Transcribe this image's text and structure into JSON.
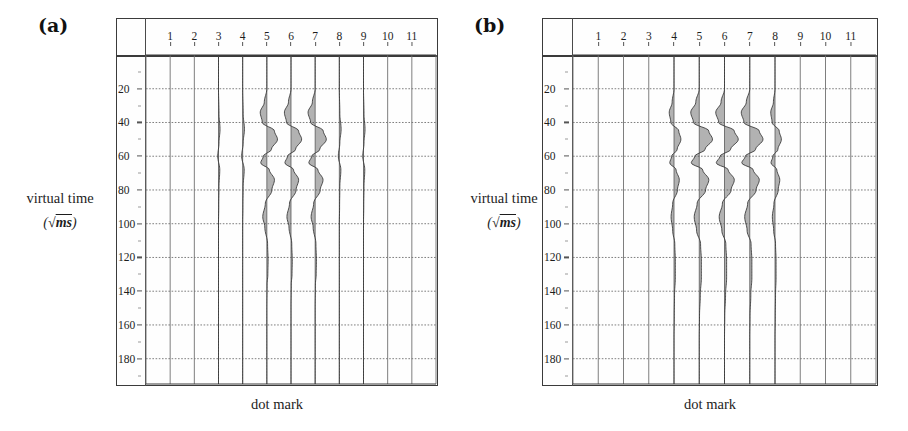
{
  "figure": {
    "background": "#ffffff",
    "axis_color": "#3b3b3b",
    "grid_color": "#6d6d6d",
    "trace_color": "#333333"
  },
  "panels": [
    {
      "id": "a",
      "label": "(a)",
      "ylabel_text": "virtual time",
      "ylabel_unit_open": "(",
      "ylabel_unit_radical": "√",
      "ylabel_unit_value": "ms",
      "ylabel_unit_close": ")",
      "xlabel": "dot mark",
      "x_ticks": [
        "1",
        "2",
        "3",
        "4",
        "5",
        "6",
        "7",
        "8",
        "9",
        "10",
        "11"
      ],
      "y_ticks": [
        "20",
        "40",
        "60",
        "80",
        "100",
        "120",
        "140",
        "160",
        "180"
      ]
    },
    {
      "id": "b",
      "label": "(b)",
      "ylabel_text": "virtual time",
      "ylabel_unit_open": "(",
      "ylabel_unit_radical": "√",
      "ylabel_unit_value": "ms",
      "ylabel_unit_close": ")",
      "xlabel": "dot mark",
      "x_ticks": [
        "1",
        "2",
        "3",
        "4",
        "5",
        "6",
        "7",
        "8",
        "9",
        "10",
        "11"
      ],
      "y_ticks": [
        "20",
        "40",
        "60",
        "80",
        "100",
        "120",
        "140",
        "160",
        "180"
      ]
    }
  ],
  "chart_data": [
    {
      "type": "line",
      "title": "(a)",
      "xlabel": "dot mark",
      "ylabel": "virtual time (√ms)",
      "xlim": [
        0.5,
        11.5
      ],
      "ylim": [
        0,
        195
      ],
      "y_inverted": true,
      "grid": true,
      "x_tick_values": [
        1,
        2,
        3,
        4,
        5,
        6,
        7,
        8,
        9,
        10,
        11
      ],
      "y_tick_values": [
        20,
        40,
        60,
        80,
        100,
        120,
        140,
        160,
        180
      ],
      "legend": "none",
      "description": "Seismic wiggle traces; amplitude plotted horizontally about each dot-mark position, virtual time increasing downward.",
      "series": [
        {
          "name": "trace 1",
          "x_center": 1,
          "amplitude": 0.0,
          "t": [
            0,
            20,
            40,
            60,
            80,
            100,
            120,
            140,
            160,
            180,
            195
          ],
          "values": [
            0,
            0,
            0,
            0,
            0,
            0,
            0,
            0,
            0,
            0,
            0
          ]
        },
        {
          "name": "trace 2",
          "x_center": 2,
          "amplitude": 0.0,
          "t": [
            0,
            20,
            40,
            60,
            80,
            100,
            120,
            140,
            160,
            180,
            195
          ],
          "values": [
            0,
            0,
            0,
            0,
            0,
            0,
            0,
            0,
            0,
            0,
            0
          ]
        },
        {
          "name": "trace 3",
          "x_center": 3,
          "amplitude": 0.06,
          "t": [
            0,
            20,
            35,
            44,
            52,
            60,
            68,
            78,
            90,
            100,
            120,
            140,
            160,
            180,
            195
          ],
          "values": [
            0,
            0,
            0.02,
            0.06,
            0.02,
            -0.03,
            0.05,
            0.02,
            0.01,
            0,
            0,
            0,
            0,
            0,
            0
          ]
        },
        {
          "name": "trace 4",
          "x_center": 4,
          "amplitude": 0.07,
          "t": [
            0,
            20,
            35,
            44,
            52,
            60,
            68,
            78,
            90,
            100,
            120,
            140,
            160,
            180,
            195
          ],
          "values": [
            0,
            0,
            0.02,
            0.07,
            0.02,
            -0.04,
            0.06,
            0.02,
            0.01,
            0,
            0,
            0,
            0,
            0,
            0
          ]
        },
        {
          "name": "trace 5",
          "x_center": 5,
          "amplitude": 0.42,
          "t": [
            0,
            20,
            28,
            34,
            40,
            45,
            50,
            56,
            60,
            64,
            68,
            74,
            80,
            88,
            96,
            102,
            112,
            122,
            130,
            136,
            150,
            165,
            180,
            195
          ],
          "values": [
            0,
            0,
            -0.1,
            -0.26,
            -0.18,
            0.3,
            0.42,
            0.18,
            -0.14,
            -0.24,
            0.1,
            0.3,
            0.2,
            -0.06,
            -0.16,
            -0.08,
            0.03,
            0.05,
            0.04,
            0.01,
            0,
            0,
            0,
            0
          ]
        },
        {
          "name": "trace 6",
          "x_center": 6,
          "amplitude": 0.42,
          "t": [
            0,
            20,
            28,
            34,
            40,
            45,
            50,
            56,
            60,
            64,
            68,
            74,
            80,
            88,
            96,
            102,
            112,
            122,
            130,
            136,
            150,
            165,
            180,
            195
          ],
          "values": [
            0,
            0,
            -0.1,
            -0.26,
            -0.18,
            0.3,
            0.42,
            0.18,
            -0.14,
            -0.24,
            0.1,
            0.3,
            0.2,
            -0.06,
            -0.16,
            -0.08,
            0.03,
            0.05,
            0.04,
            0.01,
            0,
            0,
            0,
            0
          ]
        },
        {
          "name": "trace 7",
          "x_center": 7,
          "amplitude": 0.44,
          "t": [
            0,
            20,
            28,
            34,
            40,
            45,
            50,
            56,
            60,
            64,
            68,
            74,
            80,
            88,
            96,
            102,
            112,
            122,
            130,
            136,
            150,
            165,
            180,
            195
          ],
          "values": [
            0,
            0,
            -0.11,
            -0.28,
            -0.18,
            0.32,
            0.44,
            0.18,
            -0.14,
            -0.25,
            0.11,
            0.31,
            0.2,
            -0.06,
            -0.16,
            -0.08,
            0.03,
            0.05,
            0.04,
            0.01,
            0,
            0,
            0,
            0
          ]
        },
        {
          "name": "trace 8",
          "x_center": 8,
          "amplitude": 0.07,
          "t": [
            0,
            20,
            35,
            44,
            52,
            60,
            68,
            78,
            90,
            100,
            120,
            140,
            160,
            180,
            195
          ],
          "values": [
            0,
            0,
            0.02,
            0.07,
            0.02,
            -0.04,
            0.06,
            0.02,
            0.01,
            0,
            0,
            0,
            0,
            0,
            0
          ]
        },
        {
          "name": "trace 9",
          "x_center": 9,
          "amplitude": 0.06,
          "t": [
            0,
            20,
            35,
            44,
            52,
            60,
            68,
            78,
            90,
            100,
            120,
            140,
            160,
            180,
            195
          ],
          "values": [
            0,
            0,
            0.02,
            0.06,
            0.02,
            -0.03,
            0.05,
            0.02,
            0.01,
            0,
            0,
            0,
            0,
            0,
            0
          ]
        },
        {
          "name": "trace 10",
          "x_center": 10,
          "amplitude": 0.0,
          "t": [
            0,
            20,
            40,
            60,
            80,
            100,
            120,
            140,
            160,
            180,
            195
          ],
          "values": [
            0,
            0,
            0,
            0,
            0,
            0,
            0,
            0,
            0,
            0,
            0
          ]
        },
        {
          "name": "trace 11",
          "x_center": 11,
          "amplitude": 0.0,
          "t": [
            0,
            20,
            40,
            60,
            80,
            100,
            120,
            140,
            160,
            180,
            195
          ],
          "values": [
            0,
            0,
            0,
            0,
            0,
            0,
            0,
            0,
            0,
            0,
            0
          ]
        }
      ]
    },
    {
      "type": "line",
      "title": "(b)",
      "xlabel": "dot mark",
      "ylabel": "virtual time (√ms)",
      "xlim": [
        0.5,
        11.5
      ],
      "ylim": [
        0,
        195
      ],
      "y_inverted": true,
      "grid": true,
      "x_tick_values": [
        1,
        2,
        3,
        4,
        5,
        6,
        7,
        8,
        9,
        10,
        11
      ],
      "y_tick_values": [
        20,
        40,
        60,
        80,
        100,
        120,
        140,
        160,
        180
      ],
      "legend": "none",
      "description": "Seismic wiggle traces with stronger, broader events at dot marks 4 through 8.",
      "series": [
        {
          "name": "trace 1",
          "x_center": 1,
          "amplitude": 0.0,
          "t": [
            0,
            20,
            40,
            60,
            80,
            100,
            120,
            140,
            160,
            180,
            195
          ],
          "values": [
            0,
            0,
            0,
            0,
            0,
            0,
            0,
            0,
            0,
            0,
            0
          ]
        },
        {
          "name": "trace 2",
          "x_center": 2,
          "amplitude": 0.0,
          "t": [
            0,
            20,
            40,
            60,
            80,
            100,
            120,
            140,
            160,
            180,
            195
          ],
          "values": [
            0,
            0,
            0,
            0,
            0,
            0,
            0,
            0,
            0,
            0,
            0
          ]
        },
        {
          "name": "trace 3",
          "x_center": 3,
          "amplitude": 0.0,
          "t": [
            0,
            20,
            40,
            60,
            80,
            100,
            120,
            140,
            160,
            180,
            195
          ],
          "values": [
            0,
            0,
            0,
            0,
            0,
            0,
            0,
            0,
            0,
            0,
            0
          ]
        },
        {
          "name": "trace 4",
          "x_center": 4,
          "amplitude": 0.26,
          "t": [
            0,
            20,
            28,
            34,
            40,
            45,
            50,
            56,
            60,
            64,
            68,
            74,
            80,
            88,
            96,
            104,
            112,
            122,
            132,
            142,
            155,
            168,
            180,
            195
          ],
          "values": [
            0,
            0,
            -0.07,
            -0.18,
            -0.12,
            0.18,
            0.26,
            0.12,
            -0.09,
            -0.16,
            0.08,
            0.2,
            0.13,
            -0.05,
            -0.11,
            -0.05,
            0.03,
            0.05,
            0.05,
            0.02,
            0.01,
            0,
            0,
            0
          ]
        },
        {
          "name": "trace 5",
          "x_center": 5,
          "amplitude": 0.5,
          "t": [
            0,
            20,
            28,
            34,
            40,
            45,
            50,
            56,
            60,
            64,
            68,
            74,
            80,
            88,
            96,
            104,
            112,
            122,
            132,
            142,
            155,
            168,
            180,
            195
          ],
          "values": [
            0,
            0,
            -0.13,
            -0.32,
            -0.22,
            0.36,
            0.5,
            0.22,
            -0.17,
            -0.3,
            0.13,
            0.36,
            0.24,
            -0.08,
            -0.19,
            -0.1,
            0.05,
            0.08,
            0.08,
            0.04,
            0.01,
            0,
            0,
            0
          ]
        },
        {
          "name": "trace 6",
          "x_center": 6,
          "amplitude": 0.52,
          "t": [
            0,
            20,
            28,
            34,
            40,
            45,
            50,
            56,
            60,
            64,
            68,
            74,
            80,
            88,
            96,
            104,
            112,
            122,
            132,
            142,
            155,
            168,
            180,
            195
          ],
          "values": [
            0,
            0,
            -0.13,
            -0.33,
            -0.22,
            0.37,
            0.52,
            0.23,
            -0.17,
            -0.31,
            0.14,
            0.37,
            0.25,
            -0.08,
            -0.2,
            -0.1,
            0.05,
            0.08,
            0.08,
            0.04,
            0.01,
            0,
            0,
            0
          ]
        },
        {
          "name": "trace 7",
          "x_center": 7,
          "amplitude": 0.5,
          "t": [
            0,
            20,
            28,
            34,
            40,
            45,
            50,
            56,
            60,
            64,
            68,
            74,
            80,
            88,
            96,
            104,
            112,
            122,
            132,
            142,
            155,
            168,
            180,
            195
          ],
          "values": [
            0,
            0,
            -0.13,
            -0.32,
            -0.22,
            0.36,
            0.5,
            0.22,
            -0.17,
            -0.3,
            0.13,
            0.36,
            0.24,
            -0.08,
            -0.19,
            -0.1,
            0.05,
            0.08,
            0.08,
            0.04,
            0.01,
            0,
            0,
            0
          ]
        },
        {
          "name": "trace 8",
          "x_center": 8,
          "amplitude": 0.24,
          "t": [
            0,
            20,
            28,
            34,
            40,
            45,
            50,
            56,
            60,
            64,
            68,
            74,
            80,
            88,
            96,
            104,
            112,
            122,
            132,
            142,
            155,
            168,
            180,
            195
          ],
          "values": [
            0,
            0,
            -0.06,
            -0.16,
            -0.11,
            0.16,
            0.24,
            0.11,
            -0.08,
            -0.15,
            0.07,
            0.18,
            0.12,
            -0.04,
            -0.1,
            -0.05,
            0.02,
            0.04,
            0.04,
            0.02,
            0.01,
            0,
            0,
            0
          ]
        },
        {
          "name": "trace 9",
          "x_center": 9,
          "amplitude": 0.0,
          "t": [
            0,
            20,
            40,
            60,
            80,
            100,
            120,
            140,
            160,
            180,
            195
          ],
          "values": [
            0,
            0,
            0,
            0,
            0,
            0,
            0,
            0,
            0,
            0,
            0
          ]
        },
        {
          "name": "trace 10",
          "x_center": 10,
          "amplitude": 0.0,
          "t": [
            0,
            20,
            40,
            60,
            80,
            100,
            120,
            140,
            160,
            180,
            195
          ],
          "values": [
            0,
            0,
            0,
            0,
            0,
            0,
            0,
            0,
            0,
            0,
            0
          ]
        },
        {
          "name": "trace 11",
          "x_center": 11,
          "amplitude": 0.0,
          "t": [
            0,
            20,
            40,
            60,
            80,
            100,
            120,
            140,
            160,
            180,
            195
          ],
          "values": [
            0,
            0,
            0,
            0,
            0,
            0,
            0,
            0,
            0,
            0,
            0
          ]
        }
      ]
    }
  ]
}
